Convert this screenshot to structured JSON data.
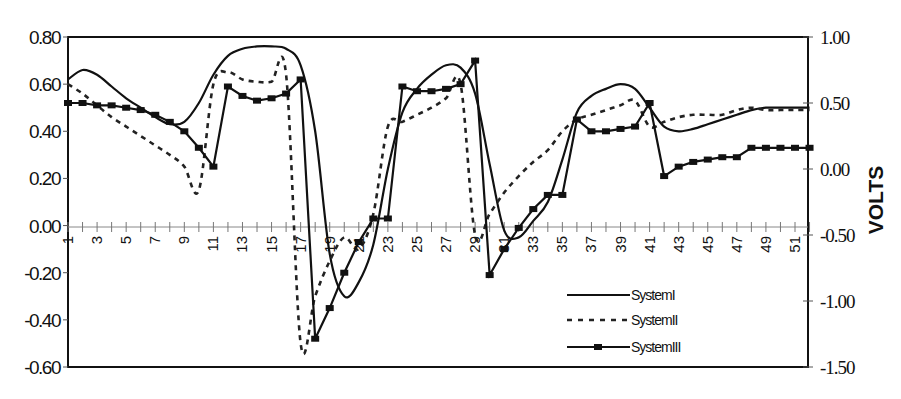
{
  "chart_data": {
    "type": "line",
    "title": "",
    "xlabel": "",
    "ylabel": "",
    "y2label": "VOLTS",
    "ylim": [
      -0.6,
      0.8
    ],
    "y2lim": [
      -1.5,
      1.0
    ],
    "yticks": [
      "0.80",
      "0.60",
      "0.40",
      "0.20",
      "0.00",
      "-0.20",
      "-0.40",
      "-0.60"
    ],
    "y2ticks": [
      "1.00",
      "0.50",
      "0.00",
      "-0.50",
      "-1.00",
      "-1.50"
    ],
    "x": [
      1,
      2,
      3,
      4,
      5,
      6,
      7,
      8,
      9,
      10,
      11,
      12,
      13,
      14,
      15,
      16,
      17,
      18,
      19,
      20,
      21,
      22,
      23,
      24,
      25,
      26,
      27,
      28,
      29,
      30,
      31,
      32,
      33,
      34,
      35,
      36,
      37,
      38,
      39,
      40,
      41,
      42,
      43,
      44,
      45,
      46,
      47,
      48,
      49,
      50,
      51,
      52
    ],
    "xtick_labels": [
      "1",
      "3",
      "5",
      "7",
      "9",
      "11",
      "13",
      "15",
      "17",
      "19",
      "21",
      "23",
      "25",
      "27",
      "29",
      "31",
      "33",
      "35",
      "37",
      "39",
      "41",
      "43",
      "45",
      "47",
      "49",
      "51"
    ],
    "grid": false,
    "legend_position": "lower right inside",
    "series": [
      {
        "name": "SystemI",
        "style": "solid",
        "values": [
          0.62,
          0.66,
          0.64,
          0.59,
          0.54,
          0.5,
          0.46,
          0.43,
          0.44,
          0.52,
          0.64,
          0.72,
          0.75,
          0.76,
          0.76,
          0.75,
          0.68,
          0.4,
          -0.12,
          -0.3,
          -0.24,
          -0.08,
          0.24,
          0.48,
          0.58,
          0.64,
          0.68,
          0.67,
          0.56,
          0.26,
          -0.02,
          -0.05,
          0.02,
          0.1,
          0.28,
          0.48,
          0.55,
          0.58,
          0.6,
          0.58,
          0.5,
          0.42,
          0.4,
          0.41,
          0.43,
          0.45,
          0.47,
          0.49,
          0.5,
          0.5,
          0.5,
          0.5
        ]
      },
      {
        "name": "SystemII",
        "style": "dashed",
        "values": [
          0.6,
          0.56,
          0.51,
          0.46,
          0.42,
          0.38,
          0.34,
          0.3,
          0.25,
          0.15,
          0.6,
          0.65,
          0.62,
          0.61,
          0.61,
          0.64,
          -0.5,
          -0.3,
          -0.15,
          -0.05,
          -0.1,
          0.05,
          0.42,
          0.44,
          0.47,
          0.5,
          0.54,
          0.6,
          -0.04,
          0.05,
          0.14,
          0.21,
          0.27,
          0.32,
          0.4,
          0.45,
          0.47,
          0.49,
          0.51,
          0.53,
          0.42,
          0.44,
          0.46,
          0.47,
          0.47,
          0.47,
          0.49,
          0.5,
          0.49,
          0.49,
          0.49,
          0.49
        ]
      },
      {
        "name": "SystemIII",
        "style": "solid-with-square-markers",
        "values": [
          0.52,
          0.52,
          0.51,
          0.51,
          0.5,
          0.49,
          0.47,
          0.44,
          0.4,
          0.33,
          0.25,
          0.59,
          0.55,
          0.53,
          0.54,
          0.56,
          0.62,
          -0.48,
          -0.35,
          -0.2,
          -0.07,
          0.03,
          0.03,
          0.59,
          0.57,
          0.57,
          0.58,
          0.6,
          0.7,
          -0.21,
          -0.1,
          -0.01,
          0.07,
          0.13,
          0.13,
          0.45,
          0.4,
          0.4,
          0.41,
          0.42,
          0.52,
          0.21,
          0.25,
          0.27,
          0.28,
          0.29,
          0.29,
          0.33,
          0.33,
          0.33,
          0.33,
          0.33
        ]
      }
    ]
  },
  "legend": {
    "items": [
      "SystemI",
      "SystemII",
      "SystemIII"
    ]
  },
  "axes": {
    "right_title": "VOLTS"
  }
}
